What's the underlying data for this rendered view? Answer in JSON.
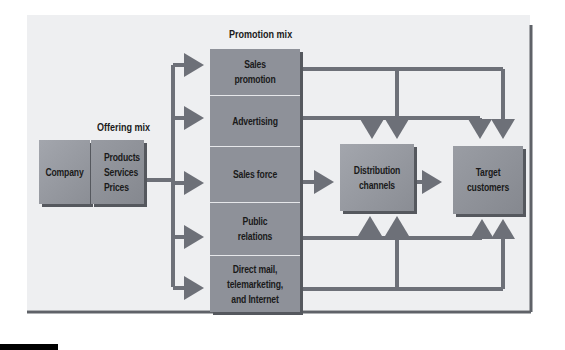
{
  "diagram": {
    "labels": {
      "promotion_mix": "Promotion mix",
      "offering_mix": "Offering mix"
    },
    "nodes": {
      "company": "Company",
      "offering": [
        "Products",
        "Services",
        "Prices"
      ],
      "sales_promotion": [
        "Sales",
        "promotion"
      ],
      "advertising": "Advertising",
      "sales_force": "Sales force",
      "public_relations": [
        "Public",
        "relations"
      ],
      "direct_mail": [
        "Direct mail,",
        "telemarketing,",
        "and Internet"
      ],
      "distribution_channels": [
        "Distribution",
        "channels"
      ],
      "target_customers": [
        "Target",
        "customers"
      ]
    },
    "colors": {
      "background": "#ecedef",
      "box_fill": "#8e9199",
      "box_fill_light": "#a7aab0",
      "arrow": "#6d7078",
      "frame": "#5f6268"
    }
  }
}
